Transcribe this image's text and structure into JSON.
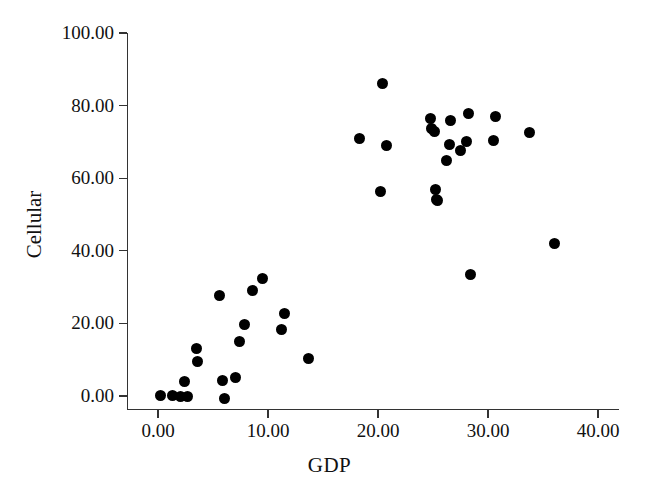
{
  "chart_data": {
    "type": "scatter",
    "title": "",
    "xlabel": "GDP",
    "ylabel": "Cellular",
    "xlim": [
      0.0,
      40.0
    ],
    "ylim": [
      0.0,
      100.0
    ],
    "grid": false,
    "legend": null,
    "marker": {
      "shape": "circle",
      "color": "#000000",
      "size_px": 11
    },
    "x_ticks": [
      "0.00",
      "10.00",
      "20.00",
      "30.00",
      "40.00"
    ],
    "y_ticks": [
      "0.00",
      "20.00",
      "40.00",
      "60.00",
      "80.00",
      "100.00"
    ],
    "x_tick_values": [
      0.0,
      10.0,
      20.0,
      30.0,
      40.0
    ],
    "y_tick_values": [
      0.0,
      20.0,
      40.0,
      60.0,
      80.0,
      100.0
    ],
    "points": [
      {
        "x": 0.2,
        "y": 0.2
      },
      {
        "x": 1.3,
        "y": 0.1
      },
      {
        "x": 2.0,
        "y": 0.0
      },
      {
        "x": 2.7,
        "y": 0.0
      },
      {
        "x": 2.4,
        "y": 4.0
      },
      {
        "x": 3.5,
        "y": 13.0
      },
      {
        "x": 3.6,
        "y": 9.5
      },
      {
        "x": 5.6,
        "y": 27.8
      },
      {
        "x": 5.9,
        "y": 4.2
      },
      {
        "x": 6.0,
        "y": -0.6
      },
      {
        "x": 7.0,
        "y": 5.2
      },
      {
        "x": 7.4,
        "y": 15.0
      },
      {
        "x": 7.9,
        "y": 19.6
      },
      {
        "x": 8.6,
        "y": 29.0
      },
      {
        "x": 9.5,
        "y": 32.5
      },
      {
        "x": 11.2,
        "y": 18.2
      },
      {
        "x": 11.5,
        "y": 22.8
      },
      {
        "x": 13.7,
        "y": 10.2
      },
      {
        "x": 18.3,
        "y": 70.8
      },
      {
        "x": 20.4,
        "y": 86.2
      },
      {
        "x": 20.8,
        "y": 69.0
      },
      {
        "x": 20.2,
        "y": 56.3
      },
      {
        "x": 24.8,
        "y": 76.5
      },
      {
        "x": 24.9,
        "y": 73.6
      },
      {
        "x": 25.1,
        "y": 73.0
      },
      {
        "x": 25.2,
        "y": 57.0
      },
      {
        "x": 25.3,
        "y": 54.0
      },
      {
        "x": 25.4,
        "y": 53.8
      },
      {
        "x": 26.6,
        "y": 76.0
      },
      {
        "x": 26.5,
        "y": 69.3
      },
      {
        "x": 26.2,
        "y": 64.8
      },
      {
        "x": 28.2,
        "y": 77.8
      },
      {
        "x": 28.0,
        "y": 70.0
      },
      {
        "x": 28.4,
        "y": 33.5
      },
      {
        "x": 27.5,
        "y": 67.5
      },
      {
        "x": 30.7,
        "y": 77.0
      },
      {
        "x": 30.5,
        "y": 70.3
      },
      {
        "x": 33.8,
        "y": 72.5
      },
      {
        "x": 36.0,
        "y": 42.0
      }
    ]
  }
}
